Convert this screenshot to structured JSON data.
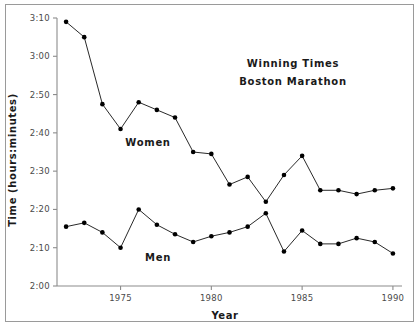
{
  "figure": {
    "title_line1": "Winning Times",
    "title_line2": "Boston Marathon",
    "border_color": "#9a9a9a",
    "background": "#ffffff"
  },
  "axes": {
    "y_axis_title": "Time (hours:minutes)",
    "x_axis_title": "Year",
    "y_tick_labels": [
      "3:10",
      "3:00",
      "2:50",
      "2:40",
      "2:30",
      "2:20",
      "2:10",
      "2:00"
    ],
    "x_tick_labels": [
      "1975",
      "1980",
      "1985",
      "1990"
    ],
    "axis_color": "#8c8c8c"
  },
  "series_labels": {
    "women": "Women",
    "men": "Men"
  },
  "chart_data": {
    "type": "line",
    "title": "Winning Times Boston Marathon",
    "xlabel": "Year",
    "ylabel": "Time (hours:minutes)",
    "xlim": [
      1971.5,
      1990.5
    ],
    "ylim": [
      120,
      190
    ],
    "ylim_labels": [
      "2:00",
      "3:10"
    ],
    "y_tick_values_minutes": [
      190,
      180,
      170,
      160,
      150,
      140,
      130,
      120
    ],
    "y_tick_labels": [
      "3:10",
      "3:00",
      "2:50",
      "2:40",
      "2:30",
      "2:20",
      "2:10",
      "2:00"
    ],
    "x_tick_values": [
      1975,
      1980,
      1985,
      1990
    ],
    "x_tick_labels": [
      "1975",
      "1980",
      "1985",
      "1990"
    ],
    "grid": false,
    "legend": "inline-annotations",
    "marker": "filled-circle",
    "marker_color": "#000000",
    "line_color": "#111111",
    "x": [
      1972,
      1973,
      1974,
      1975,
      1976,
      1977,
      1978,
      1979,
      1980,
      1981,
      1982,
      1983,
      1984,
      1985,
      1986,
      1987,
      1988,
      1989,
      1990
    ],
    "series": [
      {
        "name": "Women",
        "values_minutes": [
          189,
          185,
          167.5,
          161,
          168,
          166,
          164,
          155,
          154.5,
          146.5,
          148.5,
          142,
          149,
          154,
          145,
          145,
          144,
          145,
          145.5
        ],
        "values_clock": [
          "3:09",
          "3:05",
          "2:47.5",
          "2:41",
          "2:48",
          "2:46",
          "2:44",
          "2:35",
          "2:34.5",
          "2:26.5",
          "2:28.5",
          "2:22",
          "2:29",
          "2:34",
          "2:25",
          "2:25",
          "2:24",
          "2:25",
          "2:25.5"
        ]
      },
      {
        "name": "Men",
        "values_minutes": [
          135.5,
          136.5,
          134,
          130,
          140,
          136,
          133.5,
          131.5,
          133,
          134,
          135.5,
          139,
          129,
          134.5,
          131,
          131,
          132.5,
          131.5,
          128.5
        ],
        "values_clock": [
          "2:15.5",
          "2:16.5",
          "2:14",
          "2:10",
          "2:20",
          "2:16",
          "2:13.5",
          "2:11.5",
          "2:13",
          "2:14",
          "2:15.5",
          "2:19",
          "2:09",
          "2:14.5",
          "2:11",
          "2:11",
          "2:12.5",
          "2:11.5",
          "2:08.5"
        ]
      }
    ]
  }
}
